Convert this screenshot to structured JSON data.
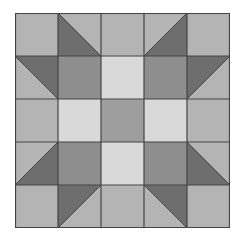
{
  "quilt": {
    "title": "",
    "grid_size": 5,
    "cell_px": 43,
    "colors": {
      "background": "#b4b4b4",
      "light": "#d9d9d9",
      "medium": "#9e9e9e",
      "medium_dark": "#8e8e8e",
      "dark": "#6e6e6e",
      "line": "#444444"
    },
    "cells": [
      {
        "row": 0,
        "col": 0,
        "type": "square",
        "fill": "background"
      },
      {
        "row": 0,
        "col": 1,
        "type": "hst",
        "diagonal": "tl-br",
        "dark_side": "bl"
      },
      {
        "row": 0,
        "col": 2,
        "type": "square",
        "fill": "background"
      },
      {
        "row": 0,
        "col": 3,
        "type": "hst",
        "diagonal": "bl-tr",
        "dark_side": "br"
      },
      {
        "row": 0,
        "col": 4,
        "type": "square",
        "fill": "background"
      },
      {
        "row": 1,
        "col": 0,
        "type": "hst",
        "diagonal": "tl-br",
        "dark_side": "tr"
      },
      {
        "row": 1,
        "col": 1,
        "type": "square",
        "fill": "medium_dark"
      },
      {
        "row": 1,
        "col": 2,
        "type": "square",
        "fill": "light"
      },
      {
        "row": 1,
        "col": 3,
        "type": "square",
        "fill": "medium_dark"
      },
      {
        "row": 1,
        "col": 4,
        "type": "hst",
        "diagonal": "bl-tr",
        "dark_side": "tl"
      },
      {
        "row": 2,
        "col": 0,
        "type": "square",
        "fill": "background"
      },
      {
        "row": 2,
        "col": 1,
        "type": "square",
        "fill": "light"
      },
      {
        "row": 2,
        "col": 2,
        "type": "square",
        "fill": "medium"
      },
      {
        "row": 2,
        "col": 3,
        "type": "square",
        "fill": "light"
      },
      {
        "row": 2,
        "col": 4,
        "type": "square",
        "fill": "background"
      },
      {
        "row": 3,
        "col": 0,
        "type": "hst",
        "diagonal": "bl-tr",
        "dark_side": "br"
      },
      {
        "row": 3,
        "col": 1,
        "type": "square",
        "fill": "medium_dark"
      },
      {
        "row": 3,
        "col": 2,
        "type": "square",
        "fill": "light"
      },
      {
        "row": 3,
        "col": 3,
        "type": "square",
        "fill": "medium_dark"
      },
      {
        "row": 3,
        "col": 4,
        "type": "hst",
        "diagonal": "tl-br",
        "dark_side": "bl"
      },
      {
        "row": 4,
        "col": 0,
        "type": "square",
        "fill": "background"
      },
      {
        "row": 4,
        "col": 1,
        "type": "hst",
        "diagonal": "bl-tr",
        "dark_side": "tl"
      },
      {
        "row": 4,
        "col": 2,
        "type": "square",
        "fill": "background"
      },
      {
        "row": 4,
        "col": 3,
        "type": "hst",
        "diagonal": "tl-br",
        "dark_side": "tr"
      },
      {
        "row": 4,
        "col": 4,
        "type": "square",
        "fill": "background"
      }
    ]
  }
}
